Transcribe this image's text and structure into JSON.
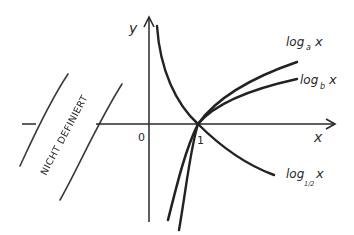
{
  "diagram": {
    "title": "",
    "axes": {
      "x_label": "x",
      "y_label": "y",
      "origin_label": "0",
      "one_label": "1"
    },
    "region": {
      "label": "NICHT DEFINIERT"
    },
    "curves": [
      {
        "id": "log_a",
        "label_base": "log",
        "label_sub": "a",
        "label_arg": "x"
      },
      {
        "id": "log_b",
        "label_base": "log",
        "label_sub": "b",
        "label_arg": "x"
      },
      {
        "id": "log_half",
        "label_base": "log",
        "label_sub": "1/2",
        "label_arg": "x"
      }
    ],
    "colors": {
      "ink": "#2a2a2a",
      "background": "#ffffff"
    }
  }
}
